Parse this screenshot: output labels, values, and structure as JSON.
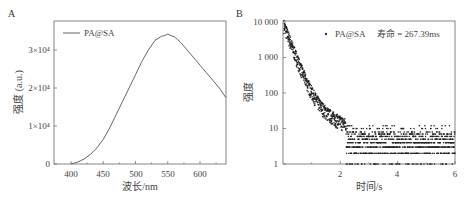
{
  "chart_data": [
    {
      "panel": "A",
      "type": "line",
      "title": "",
      "xlabel": "波长/nm",
      "ylabel": "强度 (a.u.)",
      "xlim": [
        375,
        640
      ],
      "ylim": [
        0,
        35000
      ],
      "xticks": [
        "400",
        "450",
        "500",
        "550",
        "600"
      ],
      "yticks": [
        "0",
        "1×10⁴",
        "2×10⁴",
        "3×10⁴"
      ],
      "legend": [
        "PA@SA"
      ],
      "legend_position": "upper left",
      "grid": false,
      "series": [
        {
          "name": "PA@SA",
          "x": [
            400,
            410,
            420,
            430,
            440,
            450,
            460,
            470,
            480,
            490,
            500,
            510,
            520,
            530,
            540,
            545,
            550,
            555,
            560,
            565,
            570,
            580,
            590,
            600,
            610,
            620,
            630,
            640
          ],
          "y": [
            0,
            500,
            1300,
            2500,
            4200,
            6500,
            9500,
            13000,
            16500,
            20000,
            23500,
            27000,
            30000,
            32500,
            33600,
            33800,
            34200,
            33800,
            33500,
            32800,
            32000,
            30000,
            28000,
            26000,
            24000,
            22000,
            20000,
            17500
          ]
        }
      ]
    },
    {
      "panel": "B",
      "type": "scatter",
      "title": "",
      "xlabel": "时间/s",
      "ylabel": "强度",
      "xlim": [
        0,
        6
      ],
      "ylim": [
        1,
        10000
      ],
      "yscale": "log",
      "xticks": [
        "2",
        "4",
        "6"
      ],
      "yticks": [
        "1",
        "10",
        "100",
        "1 000",
        "10 000"
      ],
      "legend": [
        "PA@SA   寿命 = 267.39ms"
      ],
      "legend_position": "upper right",
      "grid": false,
      "annotation": "寿命 = 267.39ms",
      "series": [
        {
          "name": "PA@SA",
          "x": [
            0.05,
            0.2,
            0.4,
            0.6,
            0.8,
            1.0,
            1.2,
            1.5,
            2.0,
            2.5,
            3.0,
            4.0,
            5.0,
            6.0
          ],
          "y": [
            9000,
            3500,
            1100,
            450,
            200,
            100,
            60,
            30,
            15,
            9,
            7,
            6,
            6,
            6
          ]
        }
      ]
    }
  ],
  "panels": {
    "a": {
      "label": "A",
      "legend": "PA@SA",
      "xlabel": "波长/nm",
      "ylabel": "强度 (a.u.)",
      "xticks": [
        "400",
        "450",
        "500",
        "550",
        "600"
      ],
      "yticks": [
        "0",
        "1×10⁴",
        "2×10⁴",
        "3×10⁴"
      ]
    },
    "b": {
      "label": "B",
      "legend_series": "PA@SA",
      "legend_lifetime": "寿命 = 267.39ms",
      "xlabel": "时间/s",
      "ylabel": "强度",
      "xticks": [
        "2",
        "4",
        "6"
      ],
      "yticks": [
        "1",
        "10",
        "100",
        "1 000",
        "10 000"
      ]
    }
  },
  "colors": {
    "line": "#555555",
    "points": "#222222",
    "axis": "#555555"
  }
}
